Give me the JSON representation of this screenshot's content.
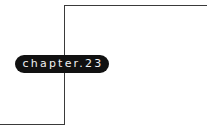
{
  "label": {
    "text": "chapter.23"
  },
  "colors": {
    "line": "#3a3a3a",
    "pill_bg": "#111111",
    "pill_text": "#f2f2f2"
  }
}
